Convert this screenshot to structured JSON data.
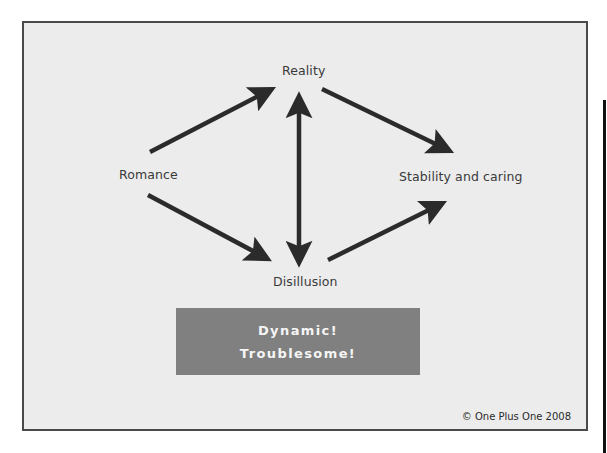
{
  "diagram": {
    "type": "relationship-stages-flow",
    "nodes": [
      {
        "id": "reality",
        "label": "Reality"
      },
      {
        "id": "romance",
        "label": "Romance"
      },
      {
        "id": "stability",
        "label": "Stability and caring"
      },
      {
        "id": "disillusion",
        "label": "Disillusion"
      }
    ],
    "edges": [
      {
        "from": "romance",
        "to": "reality",
        "direction": "one-way"
      },
      {
        "from": "reality",
        "to": "stability",
        "direction": "one-way"
      },
      {
        "from": "romance",
        "to": "disillusion",
        "direction": "one-way"
      },
      {
        "from": "disillusion",
        "to": "stability",
        "direction": "one-way"
      },
      {
        "from": "reality",
        "to": "disillusion",
        "direction": "two-way"
      }
    ]
  },
  "labels": {
    "reality": "Reality",
    "romance": "Romance",
    "stability": "Stability and caring",
    "disillusion": "Disillusion"
  },
  "banner": {
    "line1": "Dynamic!",
    "line2": "Troublesome!",
    "background_color": "#808080",
    "text_color": "#f5f5f5"
  },
  "copyright": "© One Plus One 2008",
  "colors": {
    "frame_background": "#ececec",
    "frame_border": "#4a4a4a",
    "arrow": "#2b2b2b",
    "label_text": "#3a3a3a"
  }
}
